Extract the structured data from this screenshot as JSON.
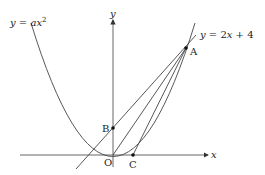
{
  "diagram": {
    "axes": {
      "x_label": "x",
      "y_label": "y",
      "origin_label": "O"
    },
    "curves": {
      "parabola_label": "y = ax²",
      "parabola_label_parts": {
        "lhs": "y",
        "eq": " = ",
        "a": "a",
        "x": "x",
        "exp": "2"
      },
      "line_label": "y = 2x + 4",
      "line_label_parts": {
        "lhs": "y",
        "eq": " = 2",
        "x": "x",
        "rest": " + 4"
      }
    },
    "points": [
      {
        "name": "A",
        "description": "intersection of parabola and line y = 2x + 4"
      },
      {
        "name": "B",
        "description": "y-intercept of line, (0, 4)"
      },
      {
        "name": "C",
        "description": "point on x-axis"
      },
      {
        "name": "O",
        "description": "origin"
      }
    ],
    "segments": [
      "OA",
      "CA",
      "BA"
    ],
    "colors": {
      "stroke": "#333333",
      "background": "#ffffff"
    }
  }
}
